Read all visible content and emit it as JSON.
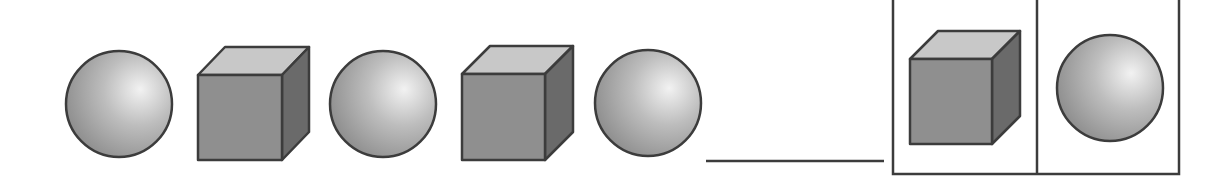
{
  "puzzle": {
    "description": "Pattern sequence: sphere, cube, sphere, cube, sphere, blank — choose the next shape",
    "sequence": [
      {
        "shape": "sphere",
        "cx": 119,
        "cy": 104,
        "r": 53
      },
      {
        "shape": "cube",
        "x": 198,
        "y": 75,
        "w": 84,
        "h": 85,
        "dx": 27,
        "dy": 28
      },
      {
        "shape": "sphere",
        "cx": 383,
        "cy": 104,
        "r": 53
      },
      {
        "shape": "cube",
        "x": 462,
        "y": 74,
        "w": 83,
        "h": 86,
        "dx": 28,
        "dy": 28
      },
      {
        "shape": "sphere",
        "cx": 648,
        "cy": 103,
        "r": 53
      }
    ],
    "blank": {
      "x1": 706,
      "x2": 884,
      "y": 161
    },
    "options_box": {
      "x": 893,
      "y": 0,
      "w": 286,
      "h": 174,
      "divider_x": 1037
    },
    "options": [
      {
        "id": "option-cube",
        "shape": "cube",
        "x": 910,
        "y": 59,
        "w": 82,
        "h": 85,
        "dx": 28,
        "dy": 28
      },
      {
        "id": "option-sphere",
        "shape": "sphere",
        "cx": 1110,
        "cy": 88,
        "r": 53
      }
    ]
  },
  "colors": {
    "outline": "#3c3c3c",
    "cube_front": "#8f8f8f",
    "cube_top": "#c8c8c8",
    "cube_side": "#6a6a6a",
    "sphere_highlight": "#f2f2f2",
    "sphere_mid": "#bdbdbd",
    "sphere_edge": "#8a8a8a"
  }
}
